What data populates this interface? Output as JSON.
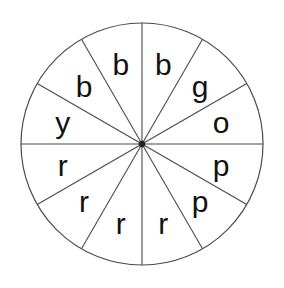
{
  "figure": {
    "name": "spinner-wheel",
    "background_color": "#ffffff",
    "line_color": "#4a4a4a",
    "text_color": "#111111",
    "hub_color": "#222222"
  },
  "geometry": {
    "center_x": 142,
    "center_y": 144,
    "radius": 121,
    "sector_count": 12,
    "sector_angle_degrees": 30,
    "label_radius": 82
  },
  "chart_data": {
    "type": "pie",
    "title": "",
    "xlabel": "",
    "ylabel": "",
    "legend": "none",
    "grid": false,
    "equal_sectors": true,
    "categories": [
      "b",
      "g",
      "o",
      "p",
      "p",
      "r",
      "r",
      "r",
      "r",
      "y",
      "b",
      "b"
    ],
    "values": [
      1,
      1,
      1,
      1,
      1,
      1,
      1,
      1,
      1,
      1,
      1,
      1
    ],
    "counts": {
      "b": 3,
      "g": 1,
      "o": 1,
      "p": 2,
      "r": 4,
      "y": 1
    },
    "total_sectors": 12
  },
  "sectors": [
    {
      "label": "b",
      "index": 0,
      "start_deg": 0,
      "end_deg": 30,
      "mid_deg": 15
    },
    {
      "label": "g",
      "index": 1,
      "start_deg": 30,
      "end_deg": 60,
      "mid_deg": 45
    },
    {
      "label": "o",
      "index": 2,
      "start_deg": 60,
      "end_deg": 90,
      "mid_deg": 75
    },
    {
      "label": "p",
      "index": 3,
      "start_deg": 90,
      "end_deg": 120,
      "mid_deg": 105
    },
    {
      "label": "p",
      "index": 4,
      "start_deg": 120,
      "end_deg": 150,
      "mid_deg": 135
    },
    {
      "label": "r",
      "index": 5,
      "start_deg": 150,
      "end_deg": 180,
      "mid_deg": 165
    },
    {
      "label": "r",
      "index": 6,
      "start_deg": 180,
      "end_deg": 210,
      "mid_deg": 195
    },
    {
      "label": "r",
      "index": 7,
      "start_deg": 210,
      "end_deg": 240,
      "mid_deg": 225
    },
    {
      "label": "r",
      "index": 8,
      "start_deg": 240,
      "end_deg": 270,
      "mid_deg": 255
    },
    {
      "label": "y",
      "index": 9,
      "start_deg": 270,
      "end_deg": 300,
      "mid_deg": 285
    },
    {
      "label": "b",
      "index": 10,
      "start_deg": 300,
      "end_deg": 330,
      "mid_deg": 315
    },
    {
      "label": "b",
      "index": 11,
      "start_deg": 330,
      "end_deg": 360,
      "mid_deg": 345
    }
  ]
}
